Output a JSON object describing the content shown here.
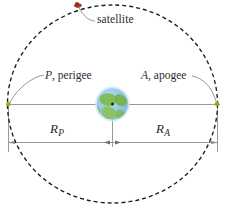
{
  "figure": {
    "type": "orbit-diagram",
    "background_color": "#ffffff"
  },
  "labels": {
    "satellite": "satellite",
    "perigee_symbol": "P",
    "perigee_separator": ", ",
    "perigee_word": "perigee",
    "apogee_symbol": "A",
    "apogee_separator": ", ",
    "apogee_word": "apogee",
    "radius_perigee_symbol": "R",
    "radius_perigee_subscript": "P",
    "radius_apogee_symbol": "R",
    "radius_apogee_subscript": "A"
  },
  "colors": {
    "orbit_dash": "#1b1b1b",
    "axis_line": "#8c8c8c",
    "leader_line": "#8a8a8a",
    "text": "#2b2b2b",
    "satellite_marker": "#a03b20",
    "node_marker": "#9aa81e",
    "earth_ocean": "#8fc4e8",
    "earth_land": "#7fbb50",
    "earth_glow": "#bcdcf2"
  },
  "geometry": {
    "orbit_center_x": 112,
    "orbit_center_y": 104,
    "orbit_radius_x": 105,
    "orbit_radius_y": 99,
    "orbit_dash_pattern": "4 3",
    "major_axis_y": 104,
    "dimension_line_y": 142,
    "left_extension_x": 8,
    "right_extension_x": 218,
    "earth_center_x": 112,
    "earth_center_y": 104,
    "earth_radius": 16,
    "satellite_x": 77,
    "satellite_y": 4,
    "perigee_node_x": 8,
    "perigee_node_y": 104,
    "apogee_node_x": 217,
    "apogee_node_y": 104
  },
  "annotations": {
    "description": "Dashed circular orbit with Earth at centre; P marks perigee at left node, A marks apogee at right node; R sub P and R sub A denote the perigee and apogee radii measured from the centre."
  }
}
